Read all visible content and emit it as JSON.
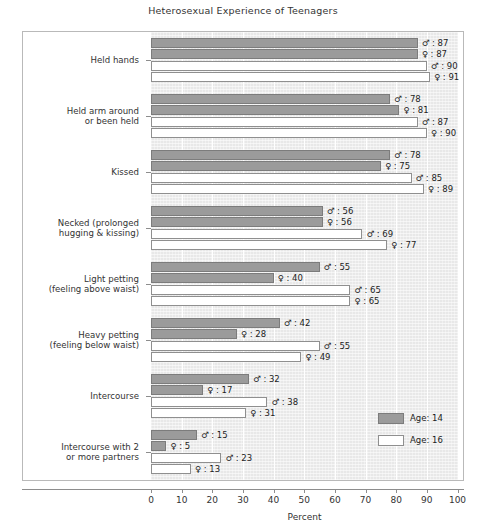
{
  "chart_data": {
    "type": "bar",
    "orientation": "horizontal",
    "title": "Heterosexual Experience of Teenagers",
    "xlabel": "Percent",
    "ylabel": "",
    "xlim": [
      0,
      100
    ],
    "xticks": [
      0,
      10,
      20,
      30,
      40,
      50,
      60,
      70,
      80,
      90,
      100
    ],
    "grid": true,
    "legend_position": "inside-right-lower",
    "legend": [
      {
        "label": "Age: 14",
        "key": "age14",
        "color": "#9b9b9b"
      },
      {
        "label": "Age: 16",
        "key": "age16",
        "color": "#ffffff"
      }
    ],
    "series_symbols": {
      "male": "♂",
      "female": "♀"
    },
    "categories": [
      "Held hands",
      "Held arm around or been held",
      "Kissed",
      "Necked (prolonged hugging & kissing)",
      "Light petting (feeling above waist)",
      "Heavy petting (feeling below waist)",
      "Intercourse",
      "Intercourse with 2 or more partners"
    ],
    "series": [
      {
        "name": "Age: 14 male",
        "key": "age14",
        "symbol": "♂",
        "values": [
          87,
          78,
          78,
          56,
          55,
          42,
          32,
          15
        ]
      },
      {
        "name": "Age: 14 female",
        "key": "age14",
        "symbol": "♀",
        "values": [
          87,
          81,
          75,
          56,
          40,
          28,
          17,
          5
        ]
      },
      {
        "name": "Age: 16 male",
        "key": "age16",
        "symbol": "♂",
        "values": [
          90,
          87,
          85,
          69,
          65,
          55,
          38,
          23
        ]
      },
      {
        "name": "Age: 16 female",
        "key": "age16",
        "symbol": "♀",
        "values": [
          91,
          90,
          89,
          77,
          65,
          49,
          31,
          13
        ]
      }
    ],
    "groups": [
      {
        "label_lines": [
          "Held hands"
        ],
        "bars": [
          {
            "symbol": "♂",
            "value": 87,
            "key": "age14",
            "text": "♂ : 87"
          },
          {
            "symbol": "♀",
            "value": 87,
            "key": "age14",
            "text": "♀ : 87"
          },
          {
            "symbol": "♂",
            "value": 90,
            "key": "age16",
            "text": "♂ : 90"
          },
          {
            "symbol": "♀",
            "value": 91,
            "key": "age16",
            "text": "♀ : 91"
          }
        ]
      },
      {
        "label_lines": [
          "Held arm around",
          "or been held"
        ],
        "bars": [
          {
            "symbol": "♂",
            "value": 78,
            "key": "age14",
            "text": "♂ : 78"
          },
          {
            "symbol": "♀",
            "value": 81,
            "key": "age14",
            "text": "♀ : 81"
          },
          {
            "symbol": "♂",
            "value": 87,
            "key": "age16",
            "text": "♂ : 87"
          },
          {
            "symbol": "♀",
            "value": 90,
            "key": "age16",
            "text": "♀ : 90"
          }
        ]
      },
      {
        "label_lines": [
          "Kissed"
        ],
        "bars": [
          {
            "symbol": "♂",
            "value": 78,
            "key": "age14",
            "text": "♂ : 78"
          },
          {
            "symbol": "♀",
            "value": 75,
            "key": "age14",
            "text": "♀ : 75"
          },
          {
            "symbol": "♂",
            "value": 85,
            "key": "age16",
            "text": "♂ : 85"
          },
          {
            "symbol": "♀",
            "value": 89,
            "key": "age16",
            "text": "♀ : 89"
          }
        ]
      },
      {
        "label_lines": [
          "Necked (prolonged",
          "hugging & kissing)"
        ],
        "bars": [
          {
            "symbol": "♂",
            "value": 56,
            "key": "age14",
            "text": "♂ : 56"
          },
          {
            "symbol": "♀",
            "value": 56,
            "key": "age14",
            "text": "♀ : 56"
          },
          {
            "symbol": "♂",
            "value": 69,
            "key": "age16",
            "text": "♂ : 69"
          },
          {
            "symbol": "♀",
            "value": 77,
            "key": "age16",
            "text": "♀ : 77"
          }
        ]
      },
      {
        "label_lines": [
          "Light petting",
          "(feeling above waist)"
        ],
        "bars": [
          {
            "symbol": "♂",
            "value": 55,
            "key": "age14",
            "text": "♂ : 55"
          },
          {
            "symbol": "♀",
            "value": 40,
            "key": "age14",
            "text": "♀ : 40"
          },
          {
            "symbol": "♂",
            "value": 65,
            "key": "age16",
            "text": "♂ : 65"
          },
          {
            "symbol": "♀",
            "value": 65,
            "key": "age16",
            "text": "♀ : 65"
          }
        ]
      },
      {
        "label_lines": [
          "Heavy petting",
          "(feeling below waist)"
        ],
        "bars": [
          {
            "symbol": "♂",
            "value": 42,
            "key": "age14",
            "text": "♂ : 42"
          },
          {
            "symbol": "♀",
            "value": 28,
            "key": "age14",
            "text": "♀ : 28"
          },
          {
            "symbol": "♂",
            "value": 55,
            "key": "age16",
            "text": "♂ : 55"
          },
          {
            "symbol": "♀",
            "value": 49,
            "key": "age16",
            "text": "♀ : 49"
          }
        ]
      },
      {
        "label_lines": [
          "Intercourse"
        ],
        "bars": [
          {
            "symbol": "♂",
            "value": 32,
            "key": "age14",
            "text": "♂ : 32"
          },
          {
            "symbol": "♀",
            "value": 17,
            "key": "age14",
            "text": "♀ : 17"
          },
          {
            "symbol": "♂",
            "value": 38,
            "key": "age16",
            "text": "♂ : 38"
          },
          {
            "symbol": "♀",
            "value": 31,
            "key": "age16",
            "text": "♀ : 31"
          }
        ]
      },
      {
        "label_lines": [
          "Intercourse with 2",
          "or more partners"
        ],
        "bars": [
          {
            "symbol": "♂",
            "value": 15,
            "key": "age14",
            "text": "♂ : 15"
          },
          {
            "symbol": "♀",
            "value": 5,
            "key": "age14",
            "text": "♀ : 5"
          },
          {
            "symbol": "♂",
            "value": 23,
            "key": "age16",
            "text": "♂ : 23"
          },
          {
            "symbol": "♀",
            "value": 13,
            "key": "age16",
            "text": "♀ : 13"
          }
        ]
      }
    ]
  }
}
